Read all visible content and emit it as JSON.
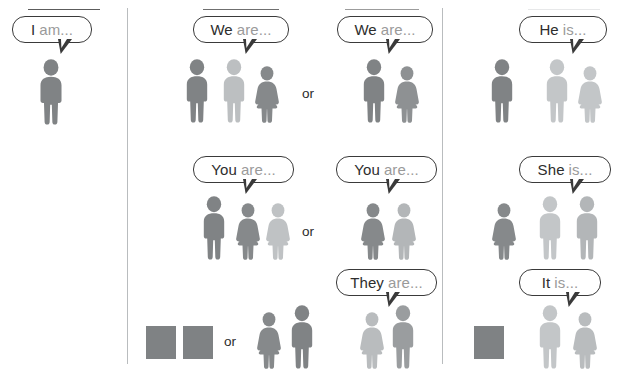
{
  "page": {
    "width": 631,
    "height": 369,
    "background": "#ffffff",
    "divider_color": "#b9bcbe"
  },
  "palette": {
    "figure_dark": "#7d8082",
    "figure_mid": "#8e9193",
    "figure_light": "#b9bcbe",
    "figure_lighter": "#c6c9cb",
    "square_fill": "#7f8284",
    "bubble_border": "#3a3a3a",
    "text_strong": "#2d2d2d",
    "text_muted": "#9a9a9a"
  },
  "columns": [
    {
      "id": "singular-first",
      "label": "I"
    },
    {
      "id": "plural",
      "label": "we-you-they"
    },
    {
      "id": "singular-third",
      "label": "he-she-it"
    }
  ],
  "or_labels": [
    {
      "id": "or-we",
      "text": "or"
    },
    {
      "id": "or-you",
      "text": "or"
    },
    {
      "id": "or-they",
      "text": "or"
    }
  ],
  "bubbles": [
    {
      "id": "i-am",
      "pronoun": "I",
      "verb": "am...",
      "x": 12,
      "y": 16,
      "w": 80,
      "tail_x": 58,
      "tail_y": 41
    },
    {
      "id": "we-are-a",
      "pronoun": "We",
      "verb": "are...",
      "x": 193,
      "y": 16,
      "w": 96,
      "tail_x": 243,
      "tail_y": 41
    },
    {
      "id": "we-are-b",
      "pronoun": "We",
      "verb": "are...",
      "x": 337,
      "y": 16,
      "w": 96,
      "tail_x": 386,
      "tail_y": 41
    },
    {
      "id": "he-is",
      "pronoun": "He",
      "verb": "is...",
      "x": 519,
      "y": 16,
      "w": 88,
      "tail_x": 570,
      "tail_y": 41
    },
    {
      "id": "you-are-a",
      "pronoun": "You",
      "verb": "are...",
      "x": 193,
      "y": 156,
      "w": 101,
      "tail_x": 243,
      "tail_y": 181
    },
    {
      "id": "you-are-b",
      "pronoun": "You",
      "verb": "are...",
      "x": 336,
      "y": 156,
      "w": 101,
      "tail_x": 386,
      "tail_y": 181
    },
    {
      "id": "she-is",
      "pronoun": "She",
      "verb": "is...",
      "x": 519,
      "y": 156,
      "w": 92,
      "tail_x": 570,
      "tail_y": 181
    },
    {
      "id": "they-are",
      "pronoun": "They",
      "verb": "are...",
      "x": 336,
      "y": 269,
      "w": 101,
      "tail_x": 386,
      "tail_y": 294
    },
    {
      "id": "it-is",
      "pronoun": "It",
      "verb": "is...",
      "x": 519,
      "y": 269,
      "w": 82,
      "tail_x": 566,
      "tail_y": 294
    }
  ],
  "figures": [
    {
      "id": "fig-i",
      "group": "i-am",
      "kind": "man",
      "tone": "#808385",
      "x": 33,
      "y": 59,
      "w": 36,
      "h": 66
    },
    {
      "id": "fig-we-a-1",
      "group": "we-are-a",
      "kind": "man",
      "tone": "#808385",
      "x": 180,
      "y": 59,
      "w": 34,
      "h": 64
    },
    {
      "id": "fig-we-a-2",
      "group": "we-are-a",
      "kind": "man",
      "tone": "#bcbfc1",
      "x": 217,
      "y": 59,
      "w": 34,
      "h": 64
    },
    {
      "id": "fig-we-a-3",
      "group": "we-are-a",
      "kind": "woman",
      "tone": "#86898b",
      "x": 252,
      "y": 66,
      "w": 30,
      "h": 57
    },
    {
      "id": "fig-we-b-1",
      "group": "we-are-b",
      "kind": "man",
      "tone": "#808385",
      "x": 357,
      "y": 59,
      "w": 34,
      "h": 64
    },
    {
      "id": "fig-we-b-2",
      "group": "we-are-b",
      "kind": "woman",
      "tone": "#8e9193",
      "x": 392,
      "y": 66,
      "w": 30,
      "h": 57
    },
    {
      "id": "fig-he-1",
      "group": "he-is",
      "kind": "man",
      "tone": "#808385",
      "x": 485,
      "y": 59,
      "w": 34,
      "h": 64
    },
    {
      "id": "fig-he-2",
      "group": "he-is",
      "kind": "man",
      "tone": "#c3c6c8",
      "x": 540,
      "y": 59,
      "w": 34,
      "h": 64
    },
    {
      "id": "fig-he-3",
      "group": "he-is",
      "kind": "woman",
      "tone": "#c3c6c8",
      "x": 575,
      "y": 66,
      "w": 30,
      "h": 57
    },
    {
      "id": "fig-you-a-1",
      "group": "you-are-a",
      "kind": "man",
      "tone": "#808385",
      "x": 197,
      "y": 196,
      "w": 34,
      "h": 64
    },
    {
      "id": "fig-you-a-2",
      "group": "you-are-a",
      "kind": "woman",
      "tone": "#86898b",
      "x": 233,
      "y": 203,
      "w": 30,
      "h": 57
    },
    {
      "id": "fig-you-a-3",
      "group": "you-are-a",
      "kind": "woman",
      "tone": "#bfc2c4",
      "x": 263,
      "y": 203,
      "w": 30,
      "h": 57
    },
    {
      "id": "fig-you-b-1",
      "group": "you-are-b",
      "kind": "woman",
      "tone": "#86898b",
      "x": 358,
      "y": 203,
      "w": 30,
      "h": 57
    },
    {
      "id": "fig-you-b-2",
      "group": "you-are-b",
      "kind": "woman",
      "tone": "#b3b6b8",
      "x": 389,
      "y": 203,
      "w": 30,
      "h": 57
    },
    {
      "id": "fig-she-1",
      "group": "she-is",
      "kind": "woman",
      "tone": "#86898b",
      "x": 489,
      "y": 203,
      "w": 30,
      "h": 57
    },
    {
      "id": "fig-she-2",
      "group": "she-is",
      "kind": "man",
      "tone": "#c3c6c8",
      "x": 533,
      "y": 196,
      "w": 34,
      "h": 64
    },
    {
      "id": "fig-she-3",
      "group": "she-is",
      "kind": "man",
      "tone": "#b3b6b8",
      "x": 570,
      "y": 196,
      "w": 34,
      "h": 64
    },
    {
      "id": "fig-they-a-1",
      "group": "they-or",
      "kind": "woman",
      "tone": "#86898b",
      "x": 254,
      "y": 312,
      "w": 30,
      "h": 57
    },
    {
      "id": "fig-they-a-2",
      "group": "they-or",
      "kind": "man",
      "tone": "#808385",
      "x": 285,
      "y": 305,
      "w": 34,
      "h": 64
    },
    {
      "id": "fig-they-b-1",
      "group": "they-are",
      "kind": "woman",
      "tone": "#b9bcbe",
      "x": 357,
      "y": 312,
      "w": 30,
      "h": 57
    },
    {
      "id": "fig-they-b-2",
      "group": "they-are",
      "kind": "man",
      "tone": "#9a9d9f",
      "x": 386,
      "y": 305,
      "w": 34,
      "h": 64
    },
    {
      "id": "fig-it-1",
      "group": "it-is",
      "kind": "man",
      "tone": "#c3c6c8",
      "x": 533,
      "y": 305,
      "w": 34,
      "h": 64
    },
    {
      "id": "fig-it-2",
      "group": "it-is",
      "kind": "woman",
      "tone": "#b9bcbe",
      "x": 570,
      "y": 312,
      "w": 30,
      "h": 57
    }
  ],
  "squares": [
    {
      "id": "square-they-1",
      "group": "they-or",
      "x": 146,
      "y": 326,
      "w": 30,
      "h": 33,
      "fill": "#7f8284"
    },
    {
      "id": "square-they-2",
      "group": "they-or",
      "x": 183,
      "y": 326,
      "w": 30,
      "h": 33,
      "fill": "#7f8284"
    },
    {
      "id": "square-it",
      "group": "it-is",
      "x": 474,
      "y": 326,
      "w": 30,
      "h": 33,
      "fill": "#7f8284"
    }
  ],
  "dividers": [
    {
      "id": "divider-left",
      "x": 127,
      "y": 8,
      "h": 356
    },
    {
      "id": "divider-right",
      "x": 442,
      "y": 8,
      "h": 356
    }
  ]
}
